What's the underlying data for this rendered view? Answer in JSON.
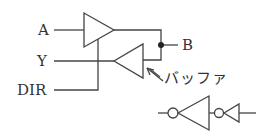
{
  "diagram": {
    "labels": {
      "a": "A",
      "y": "Y",
      "dir": "DIR",
      "b": "B",
      "buffer": "バッファ"
    },
    "stroke_color": "#444444",
    "components": [
      {
        "type": "tri-state-buffer",
        "direction": "A to B",
        "enable": "DIR"
      },
      {
        "type": "tri-state-buffer",
        "direction": "B to Y"
      },
      {
        "type": "junction",
        "node": "B"
      },
      {
        "type": "legend-symbol",
        "description": "buffer drawn as two cascaded inverters"
      }
    ]
  }
}
